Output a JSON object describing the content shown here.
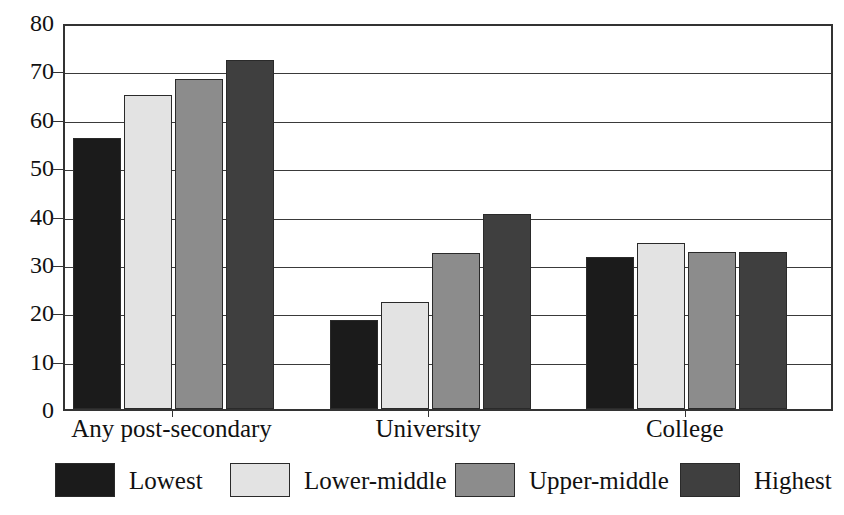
{
  "chart_data": {
    "type": "bar",
    "title": "",
    "xlabel": "",
    "ylabel": "",
    "ylim": [
      0,
      80
    ],
    "yticks": [
      0,
      10,
      20,
      30,
      40,
      50,
      60,
      70,
      80
    ],
    "grid": true,
    "legend_position": "bottom",
    "categories": [
      "Any post-secondary",
      "University",
      "College"
    ],
    "series": [
      {
        "name": "Lowest",
        "color": "#1b1b1b",
        "values": [
          56.0,
          18.3,
          31.4
        ]
      },
      {
        "name": "Lower-middle",
        "color": "#e3e3e3",
        "values": [
          65.0,
          22.2,
          34.4
        ]
      },
      {
        "name": "Upper-middle",
        "color": "#8c8c8c",
        "values": [
          68.2,
          32.3,
          32.4
        ]
      },
      {
        "name": "Highest",
        "color": "#3f3f3f",
        "values": [
          72.2,
          40.3,
          32.4
        ]
      }
    ]
  },
  "axis": {
    "y_tick_labels": [
      "80",
      "70",
      "60",
      "50",
      "40",
      "30",
      "20",
      "10",
      "0"
    ],
    "x_tick_labels": [
      "Any post-secondary",
      "University",
      "College"
    ]
  },
  "legend": {
    "entries": [
      {
        "label": "Lowest",
        "color": "#1b1b1b"
      },
      {
        "label": "Lower-middle",
        "color": "#e3e3e3"
      },
      {
        "label": "Upper-middle",
        "color": "#8c8c8c"
      },
      {
        "label": "Highest",
        "color": "#3f3f3f"
      }
    ]
  },
  "caption_remnant": ""
}
